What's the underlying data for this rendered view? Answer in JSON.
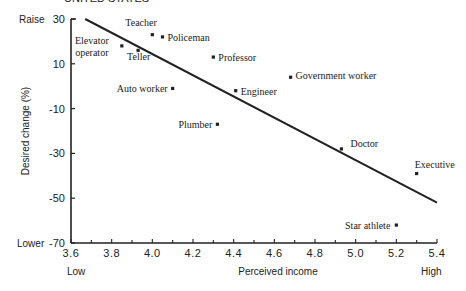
{
  "header": {
    "cut_title": "UNITED STATES"
  },
  "chart_data": {
    "type": "scatter",
    "title": "",
    "xlabel": "Perceived income",
    "ylabel": "Desired change (%)",
    "xlim": [
      3.6,
      5.4
    ],
    "ylim": [
      -70,
      30
    ],
    "x_ticks": [
      "3.6",
      "3.8",
      "4.0",
      "4.2",
      "4.4",
      "4.6",
      "4.8",
      "5.0",
      "5.2",
      "5.4"
    ],
    "y_ticks": [
      "30",
      "10",
      "-10",
      "-30",
      "-50",
      "-70"
    ],
    "x_end_labels": {
      "low": "Low",
      "high": "High"
    },
    "y_end_labels": {
      "high": "Raise",
      "low": "Lower"
    },
    "grid": false,
    "legend": null,
    "points": [
      {
        "label": "Elevator operator",
        "x": 3.85,
        "y": 18
      },
      {
        "label": "Teller",
        "x": 3.93,
        "y": 16
      },
      {
        "label": "Teacher",
        "x": 4.0,
        "y": 23
      },
      {
        "label": "Policeman",
        "x": 4.05,
        "y": 22
      },
      {
        "label": "Professor",
        "x": 4.3,
        "y": 13
      },
      {
        "label": "Auto worker",
        "x": 4.1,
        "y": -1
      },
      {
        "label": "Engineer",
        "x": 4.41,
        "y": -2
      },
      {
        "label": "Government worker",
        "x": 4.68,
        "y": 4
      },
      {
        "label": "Plumber",
        "x": 4.32,
        "y": -17
      },
      {
        "label": "Doctor",
        "x": 4.93,
        "y": -28
      },
      {
        "label": "Executive",
        "x": 5.3,
        "y": -39
      },
      {
        "label": "Star athlete",
        "x": 5.2,
        "y": -62
      }
    ],
    "trend_line": {
      "x": [
        3.67,
        5.4
      ],
      "y": [
        30,
        -52
      ]
    }
  }
}
